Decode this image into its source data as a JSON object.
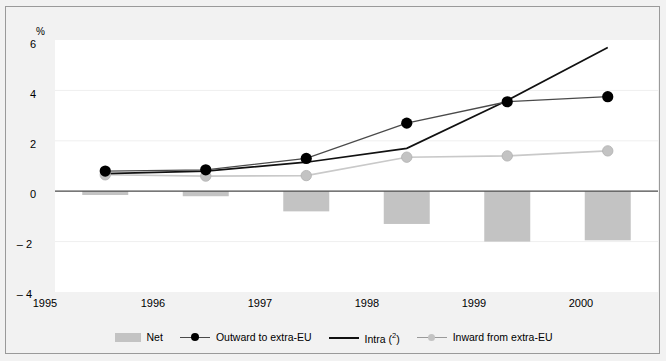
{
  "chart_data": {
    "type": "line",
    "title": "",
    "subtitle": "",
    "unit_label": "%",
    "xlabel": "",
    "ylabel": "",
    "categories": [
      "1995",
      "1996",
      "1997",
      "1998",
      "1999",
      "2000"
    ],
    "ylim": [
      -4,
      6
    ],
    "yticks": [
      6,
      4,
      2,
      0,
      -2,
      -4
    ],
    "ytick_labels": [
      "6",
      "4",
      "2",
      "0",
      "– 2",
      "– 4"
    ],
    "grid": "horizontal-light",
    "legend_position": "bottom-center",
    "series": [
      {
        "name": "Net",
        "type": "bar",
        "color": "#c3c3c3",
        "values": [
          -0.15,
          -0.2,
          -0.8,
          -1.3,
          -2.0,
          -1.95
        ]
      },
      {
        "name": "Outward to extra-EU",
        "type": "line-marker",
        "color": "#000000",
        "marker": "filled-circle-black",
        "values": [
          0.8,
          0.85,
          1.3,
          2.7,
          3.55,
          3.75
        ]
      },
      {
        "name": "Intra (2)",
        "type": "line",
        "color": "#000000",
        "marker": "none",
        "values": [
          0.7,
          0.8,
          1.15,
          1.7,
          3.6,
          5.7
        ]
      },
      {
        "name": "Inward from extra-EU",
        "type": "line-marker",
        "color": "#bdbdbd",
        "marker": "filled-circle-grey",
        "values": [
          0.65,
          0.6,
          0.62,
          1.35,
          1.4,
          1.6
        ]
      }
    ]
  },
  "legend": {
    "items": [
      {
        "label": "Net",
        "glyph": "bar-swatch-icon"
      },
      {
        "label": "Outward to extra-EU",
        "glyph": "line-black-dot-icon"
      },
      {
        "label": "Intra (",
        "label_sup": "2",
        "label_tail": ")",
        "glyph": "line-black-icon"
      },
      {
        "label": "Inward from extra-EU",
        "glyph": "line-grey-dot-icon"
      }
    ]
  },
  "colors": {
    "figure_background": "#f2f2f2",
    "plot_background": "#ffffff",
    "frame_border": "#9a9a9a",
    "bar_fill": "#c3c3c3",
    "black_series": "#000000",
    "grey_series": "#bdbdbd",
    "gridline": "#eeeeee",
    "zero_line": "#4a4a4a"
  }
}
